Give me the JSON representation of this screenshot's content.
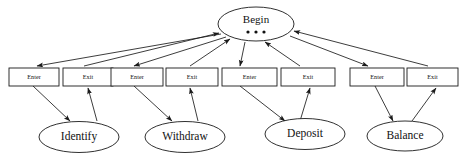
{
  "diagram": {
    "begin_node": {
      "label": "Begin",
      "dots": "• • •",
      "shape": "ellipse"
    },
    "activities": [
      {
        "name": "Identify",
        "enter_label": "Enter",
        "exit_label": "Exit"
      },
      {
        "name": "Withdraw",
        "enter_label": "Enter",
        "exit_label": "Exit"
      },
      {
        "name": "Deposit",
        "enter_label": "Enter",
        "exit_label": "Exit"
      },
      {
        "name": "Balance",
        "enter_label": "Enter",
        "exit_label": "Exit"
      }
    ],
    "colors": {
      "stroke": "#1a1a1a",
      "fill": "#ffffff",
      "text": "#111111",
      "background": "#ffffff"
    }
  }
}
